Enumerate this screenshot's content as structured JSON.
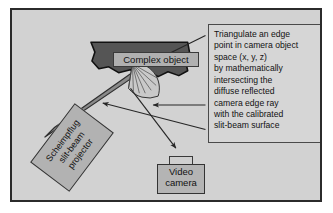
{
  "figure": {
    "panel_background": "#d2d2d2",
    "border_color": "#2b2b2b"
  },
  "annotation": {
    "text": "Triangulate an edge\npoint in camera object\nspace (x, y, z)\nby mathematically\nintersecting the\ndiffuse reflected\ncamera edge ray\nwith the calibrated\nslit-beam surface",
    "lines": [
      "Triangulate an edge",
      "point in camera object",
      "space (x, y, z)",
      "by mathematically",
      "intersecting the",
      "diffuse reflected",
      "camera edge ray",
      "with the calibrated",
      "slit-beam surface"
    ]
  },
  "labels": {
    "complex_object": "Complex object",
    "projector": "Scheimpflug\nslit-beam\nprojector",
    "video_camera": "Video\ncamera"
  },
  "shapes": {
    "object_fill": "#555555",
    "object_stroke": "#111111",
    "beam_fill": "#8a8a8a",
    "beam_stroke": "#2f2f2f",
    "fan_fill": "#c8c8c8",
    "fan_stroke": "#333333",
    "arrow_color": "#262626"
  }
}
